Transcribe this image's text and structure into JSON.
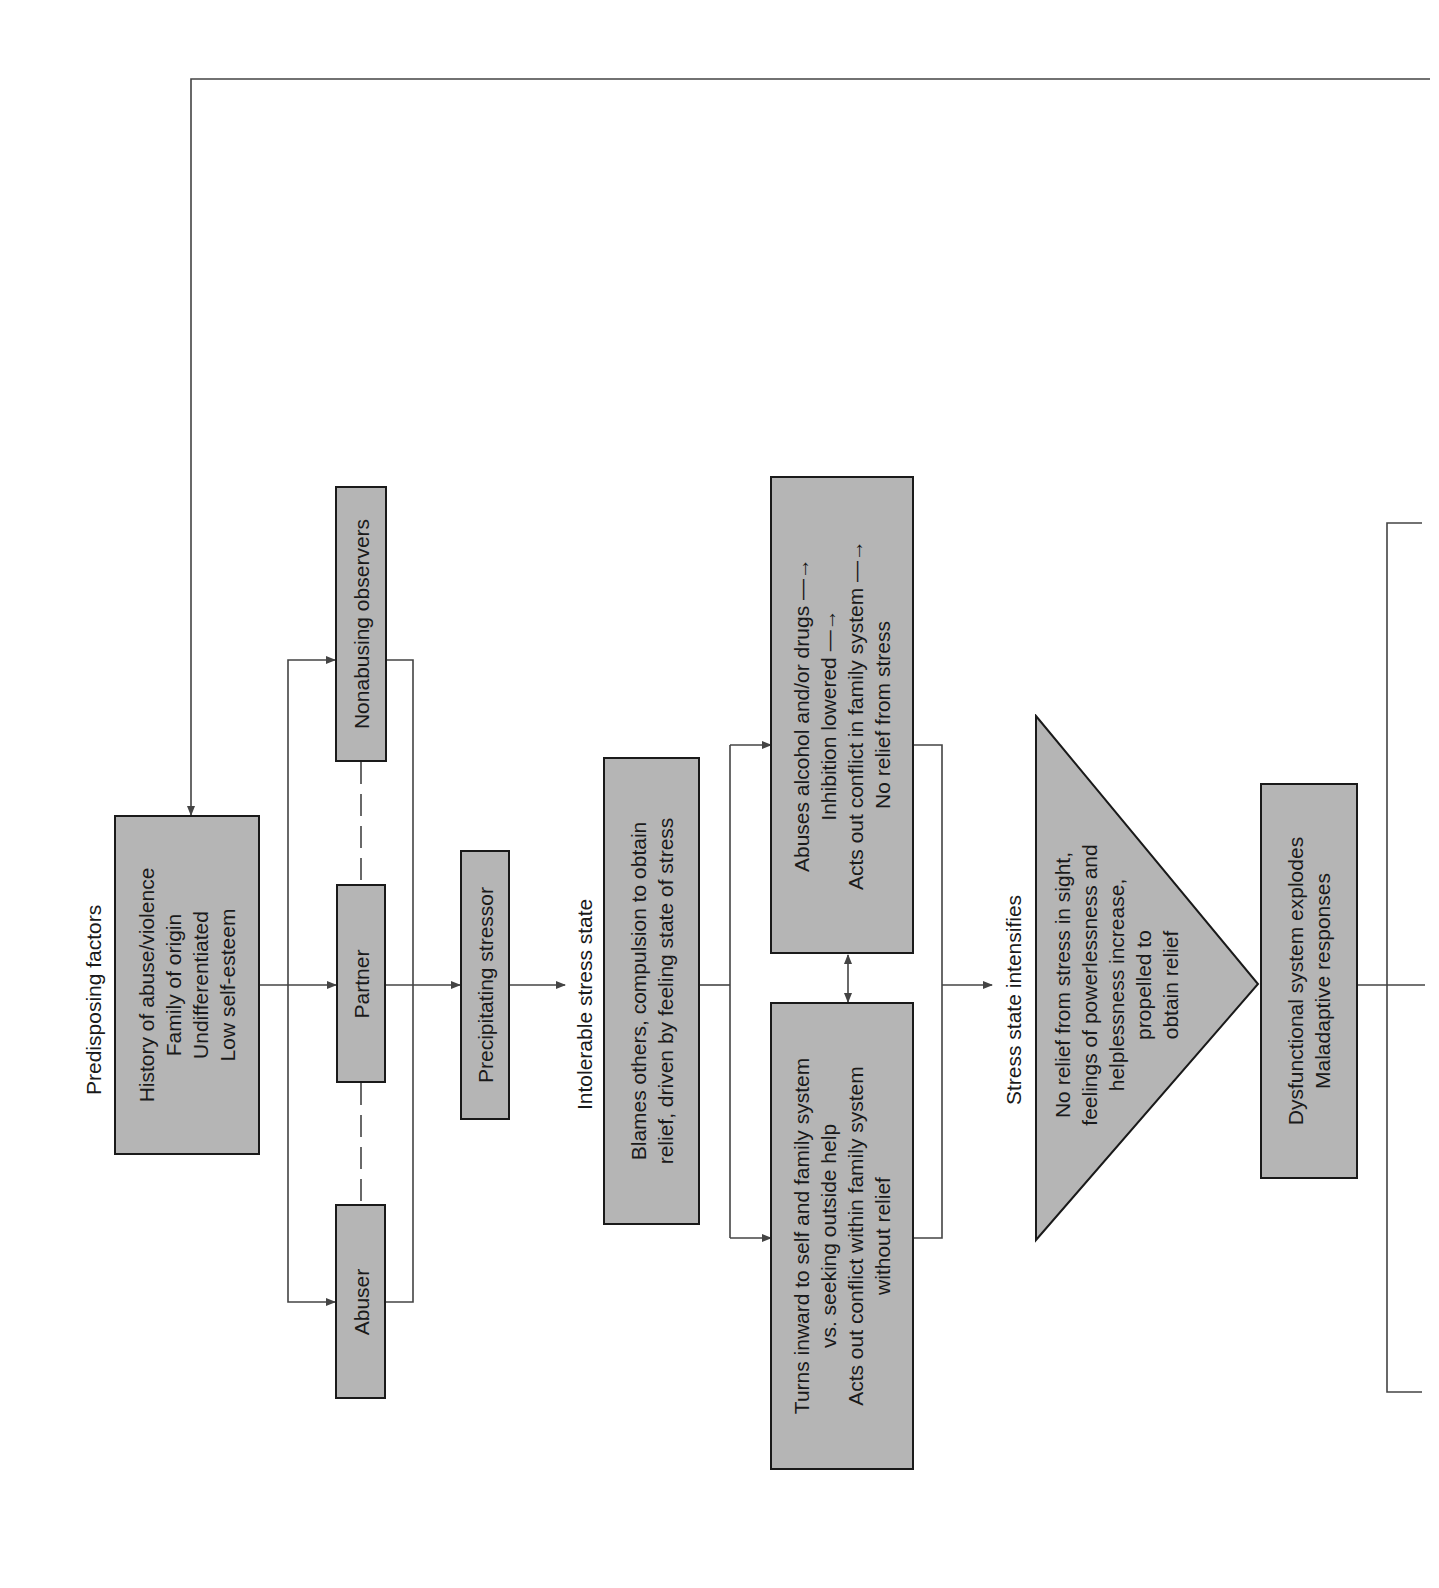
{
  "colors": {
    "box_fill": "#b5b5b5",
    "stroke": "#1a1a1a",
    "line": "#444444",
    "background": "#ffffff"
  },
  "orientation": "rotated-90-ccw",
  "labels": {
    "predisposing": "Predisposing factors",
    "intolerable": "Intolerable stress state",
    "intensifies": "Stress state intensifies"
  },
  "nodes": {
    "history": {
      "lines": [
        "History of abuse/violence",
        "Family of origin",
        "Undifferentiated",
        "Low self-esteem"
      ]
    },
    "nonabusing": {
      "lines": [
        "Nonabusing observers"
      ]
    },
    "partner": {
      "lines": [
        "Partner"
      ]
    },
    "abuser": {
      "lines": [
        "Abuser"
      ]
    },
    "precipitating": {
      "lines": [
        "Precipitating stressor"
      ]
    },
    "blames": {
      "lines": [
        "Blames others, compulsion to obtain",
        "relief, driven by feeling state of stress"
      ]
    },
    "abuses": {
      "lines": [
        "Abuses alcohol and/or drugs —→",
        "Inhibition lowered —→",
        "Acts out conflict in family system —→",
        "No relief from stress"
      ]
    },
    "turns": {
      "lines": [
        "Turns inward to self and family system",
        "vs. seeking outside help",
        "Acts out conflict within family system",
        "without relief"
      ]
    },
    "triangle": {
      "lines": [
        "No relief from stress in sight,",
        "feelings of powerlessness and",
        "helplessness increase,",
        "propelled to",
        "obtain relief"
      ]
    },
    "dysfunctional": {
      "lines": [
        "Dysfunctional system explodes",
        "Maladaptive responses"
      ]
    }
  }
}
